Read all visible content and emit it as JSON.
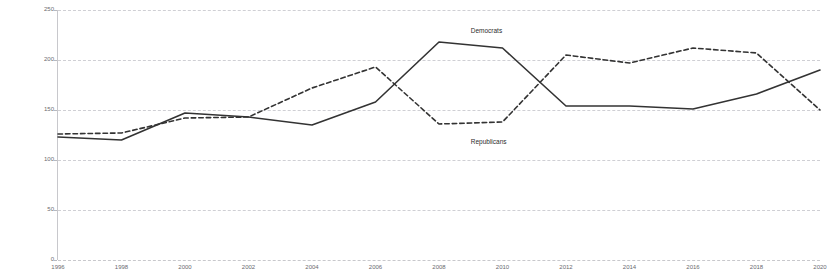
{
  "chart_data": {
    "type": "line",
    "title": "",
    "xlabel": "",
    "ylabel": "Millions",
    "x": [
      1996,
      1998,
      2000,
      2002,
      2004,
      2006,
      2008,
      2010,
      2012,
      2014,
      2016,
      2018,
      2020
    ],
    "xticklabels": [
      "1996",
      "1998",
      "2000",
      "2002",
      "2004",
      "2006",
      "2008",
      "2010",
      "2012",
      "2014",
      "2016",
      "2018",
      "2020"
    ],
    "yticklabels": [
      "0",
      "50",
      "100",
      "150",
      "200",
      "250"
    ],
    "yticks": [
      0,
      50,
      100,
      150,
      200,
      250
    ],
    "ylim": [
      0,
      250
    ],
    "xlim": [
      1996,
      2020
    ],
    "grid": true,
    "legend_position": "inline-annotation",
    "series": [
      {
        "name": "Democrats",
        "style": "solid",
        "color": "#333333",
        "label_x": 2009,
        "label_y": 233,
        "values": [
          123,
          120,
          147,
          143,
          135,
          158,
          218,
          212,
          154,
          154,
          151,
          166,
          190
        ]
      },
      {
        "name": "Republicans",
        "style": "dashed",
        "color": "#333333",
        "label_x": 2009,
        "label_y": 122,
        "values": [
          126,
          127,
          142,
          143,
          172,
          193,
          136,
          138,
          205,
          197,
          212,
          207,
          150
        ]
      }
    ]
  }
}
